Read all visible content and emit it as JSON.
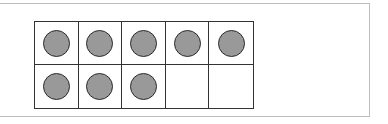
{
  "ten_frame": {
    "rows": 2,
    "columns": 5,
    "filled_count": 8,
    "total_cells": 10,
    "cells": [
      {
        "row": 1,
        "col": 1,
        "filled": true
      },
      {
        "row": 1,
        "col": 2,
        "filled": true
      },
      {
        "row": 1,
        "col": 3,
        "filled": true
      },
      {
        "row": 1,
        "col": 4,
        "filled": true
      },
      {
        "row": 1,
        "col": 5,
        "filled": true
      },
      {
        "row": 2,
        "col": 1,
        "filled": true
      },
      {
        "row": 2,
        "col": 2,
        "filled": true
      },
      {
        "row": 2,
        "col": 3,
        "filled": true
      },
      {
        "row": 2,
        "col": 4,
        "filled": false
      },
      {
        "row": 2,
        "col": 5,
        "filled": false
      }
    ],
    "colors": {
      "counter_fill": "#999999",
      "counter_stroke": "#2a2a2a",
      "grid_line": "#333333",
      "frame_border": "#bdbdbd"
    }
  }
}
